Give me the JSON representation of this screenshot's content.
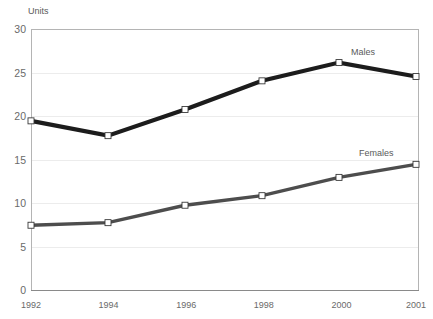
{
  "chart_data": {
    "type": "line",
    "title": "",
    "xlabel": "",
    "ylabel": "Units",
    "categories": [
      "1992",
      "1994",
      "1996",
      "1998",
      "2000",
      "2001"
    ],
    "ylim": [
      0,
      30
    ],
    "yticks": [
      0,
      5,
      10,
      15,
      20,
      25,
      30
    ],
    "grid": true,
    "legend_position": "inline-right-of-last-point",
    "series": [
      {
        "name": "Males",
        "values": [
          19.5,
          17.8,
          20.8,
          24.1,
          26.2,
          24.6
        ],
        "color": "#1c1c1c",
        "line_width": 4.2,
        "marker": "square",
        "label_anchor_index": 4
      },
      {
        "name": "Females",
        "values": [
          7.5,
          7.8,
          9.8,
          10.9,
          13.0,
          14.5
        ],
        "color": "#4d4d4d",
        "line_width": 3.4,
        "marker": "square",
        "label_anchor_index": 5
      }
    ]
  },
  "axis": {
    "y_title": "Units",
    "y_tick_labels": [
      "30",
      "25",
      "20",
      "15",
      "10",
      "5",
      "0"
    ],
    "x_tick_labels": [
      "1992",
      "1994",
      "1996",
      "1998",
      "2000",
      "2001"
    ]
  },
  "series_labels": {
    "males": "Males",
    "females": "Females"
  },
  "colors": {
    "males_line": "#1c1c1c",
    "females_line": "#4d4d4d",
    "gridline": "#ececec",
    "frame": "#b4b4b4",
    "baseline": "#8a8a8a",
    "tick_text": "#6a6a6a",
    "marker_fill": "#ffffff",
    "background": "#ffffff"
  }
}
